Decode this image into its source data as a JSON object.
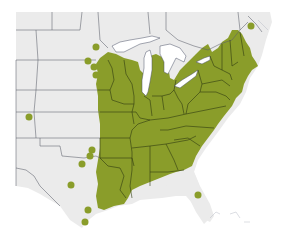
{
  "map": {
    "title": "",
    "region": "Central and Eastern United States",
    "colors": {
      "background": "#ffffff",
      "land": "#ebebeb",
      "range": "#8a9d2a",
      "state_border": "#5c5f6b",
      "water": "#ffffff"
    },
    "layers": [
      {
        "name": "native-range",
        "color": "#8a9d2a",
        "description": "Shaded distribution area covering eastern US"
      },
      {
        "name": "outlying-occurrences",
        "color": "#8a9d2a",
        "description": "Isolated dots west of main range"
      }
    ],
    "outlying_points": [
      {
        "x": 96,
        "y": 47
      },
      {
        "x": 88,
        "y": 61
      },
      {
        "x": 94,
        "y": 67
      },
      {
        "x": 96,
        "y": 75
      },
      {
        "x": 29,
        "y": 117
      },
      {
        "x": 91,
        "y": 150
      },
      {
        "x": 89,
        "y": 155
      },
      {
        "x": 82,
        "y": 164
      },
      {
        "x": 71,
        "y": 185
      },
      {
        "x": 88,
        "y": 210
      },
      {
        "x": 85,
        "y": 222
      },
      {
        "x": 198,
        "y": 195
      },
      {
        "x": 251,
        "y": 26
      }
    ]
  }
}
